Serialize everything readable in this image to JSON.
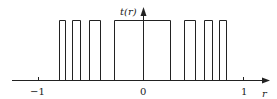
{
  "figure": {
    "y_label": "t(r)",
    "x_label": "r",
    "ticks": [
      {
        "label": "−1",
        "x": 38
      },
      {
        "label": "0",
        "x": 143
      },
      {
        "label": "1",
        "x": 243
      }
    ],
    "pulses_px": [
      [
        59,
        65
      ],
      [
        72,
        80
      ],
      [
        89,
        100
      ],
      [
        114,
        170
      ],
      [
        184,
        195
      ],
      [
        204,
        212
      ],
      [
        219,
        226
      ]
    ],
    "line_color": "#222222"
  }
}
